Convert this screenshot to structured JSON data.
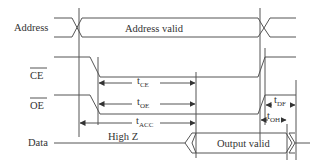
{
  "signals": {
    "address": "Address",
    "ce": "CE",
    "oe": "OE",
    "data": "Data"
  },
  "bus_labels": {
    "address_valid": "Address valid",
    "high_z": "High Z",
    "output_valid": "Output valid"
  },
  "timings": {
    "tce": {
      "t": "t",
      "sub": "CE"
    },
    "toe": {
      "t": "t",
      "sub": "OE"
    },
    "tacc": {
      "t": "t",
      "sub": "ACC"
    },
    "tdf": {
      "t": "t",
      "sub": "DF"
    },
    "toh": {
      "t": "t",
      "sub": "OH"
    }
  },
  "colors": {
    "line": "#555555",
    "text": "#333333",
    "background": "#ffffff"
  }
}
